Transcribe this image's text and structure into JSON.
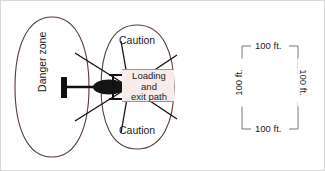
{
  "figure": {
    "colors": {
      "zone_outline": "#5a3a33",
      "loading_box_fill": "#f7ece9",
      "loading_box_border": "#b9897f",
      "machine_fill": "#1a1a1a",
      "dimension_line": "#6f7a78",
      "text": "#1b1b1b",
      "page_border": "#d8d8d8"
    },
    "left_diagram": {
      "danger_zone_label": "Danger zone",
      "caution_top_label": "Caution",
      "caution_bottom_label": "Caution",
      "loading_path_label": "Loading\nand\nexit path",
      "loading_path_line1": "Loading",
      "loading_path_line2": "and",
      "loading_path_line3": "exit path"
    },
    "right_diagram": {
      "top_label": "100 ft.",
      "right_label": "100 ft.",
      "bottom_label": "100 ft.",
      "left_label": "100 ft."
    }
  }
}
